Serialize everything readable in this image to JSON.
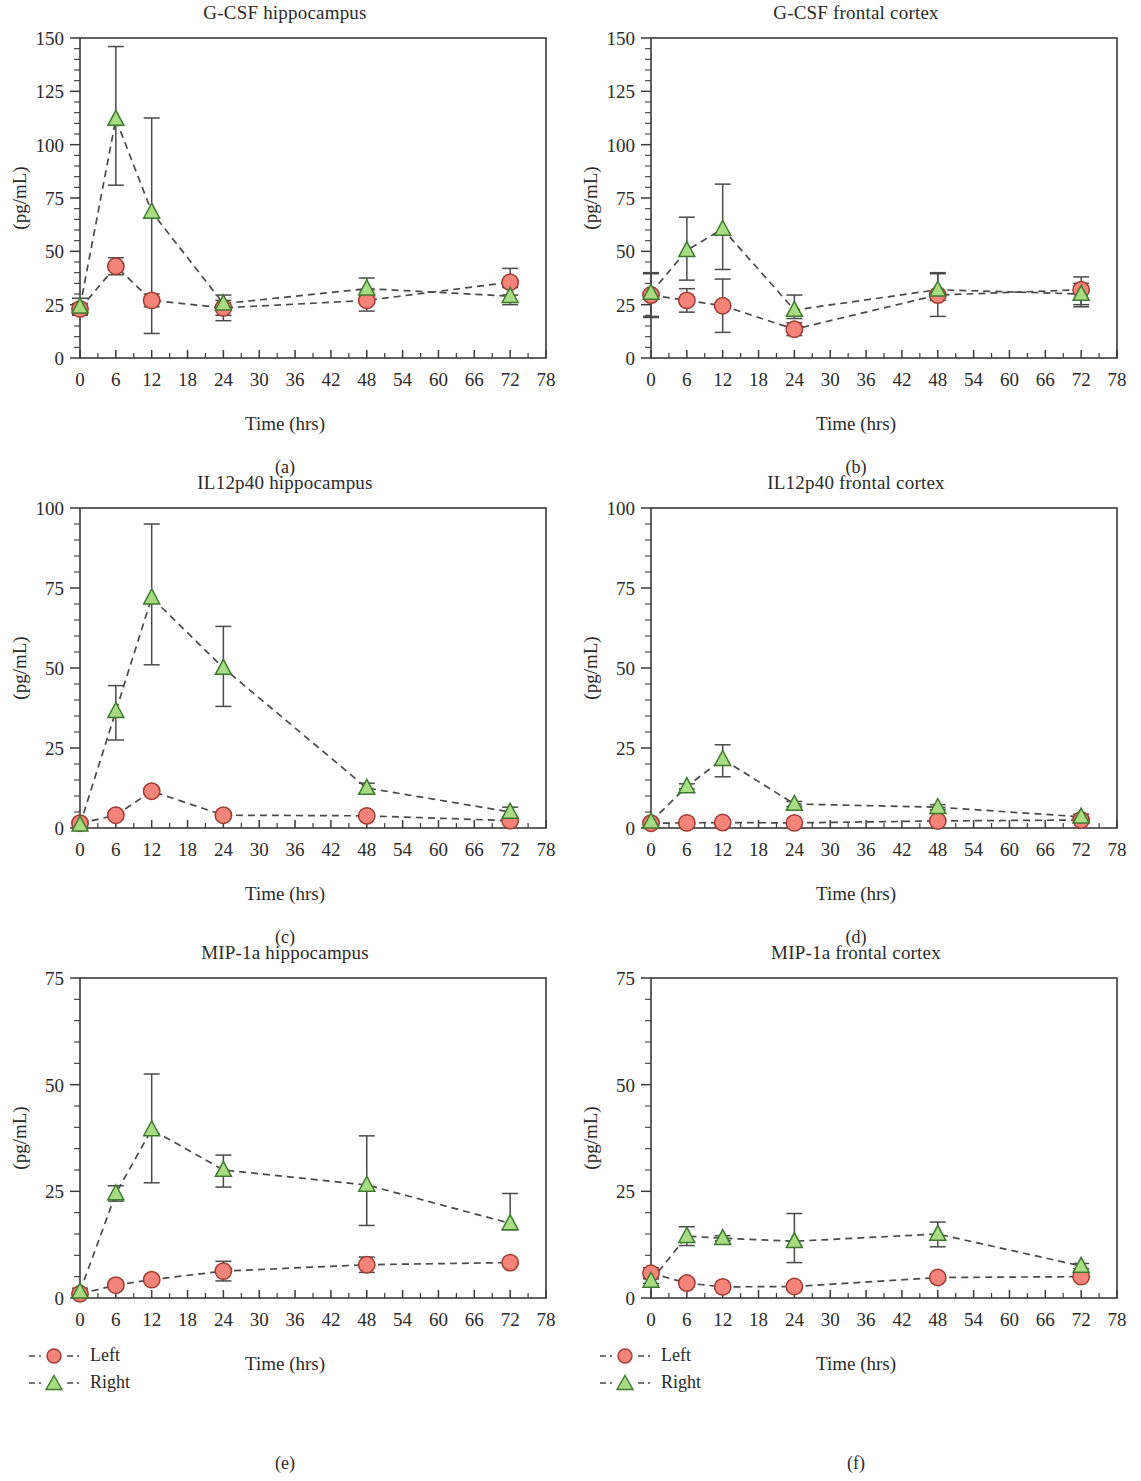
{
  "figure": {
    "xlabel": "Time (hrs)",
    "ylabel": "(pg/mL)",
    "legend": {
      "left_label": "Left",
      "right_label": "Right"
    },
    "colors": {
      "left_fill": "#F4837A",
      "left_stroke": "#9E3B33",
      "right_fill": "#A8DC82",
      "right_stroke": "#3E7A2E",
      "line": "#4A4A4A",
      "axis": "#3A3A3A",
      "text": "#2A2A2A"
    }
  },
  "panels": [
    {
      "letter": "(a)",
      "chart_data": {
        "type": "line",
        "title": "G-CSF hippocampus",
        "xlabel": "Time (hrs)",
        "ylabel": "(pg/mL)",
        "xlim": [
          0,
          78
        ],
        "ylim": [
          0,
          150
        ],
        "xticks": [
          0,
          6,
          12,
          18,
          24,
          30,
          36,
          42,
          48,
          54,
          60,
          66,
          72,
          78
        ],
        "yticks": [
          0,
          25,
          50,
          75,
          100,
          125,
          150
        ],
        "grid": false,
        "legend_position": "below-left",
        "x": [
          0,
          6,
          12,
          24,
          48,
          72
        ],
        "series": [
          {
            "name": "Left",
            "marker": "circle",
            "values": [
              23,
              43,
              27,
              23.5,
              27,
              35.5
            ],
            "err_low": [
              2.5,
              4,
              3,
              3.5,
              5,
              6
            ],
            "err_high": [
              2.5,
              4,
              3,
              3.5,
              5,
              6.5
            ]
          },
          {
            "name": "Right",
            "marker": "triangle",
            "values": [
              24,
              112,
              68.5,
              25.5,
              32.5,
              29
            ],
            "err_low": [
              4,
              31,
              57,
              8,
              5,
              4
            ],
            "err_high": [
              4,
              34,
              44,
              4,
              5,
              4
            ]
          }
        ]
      }
    },
    {
      "letter": "(b)",
      "chart_data": {
        "type": "line",
        "title": "G-CSF frontal cortex",
        "xlabel": "Time (hrs)",
        "ylabel": "(pg/mL)",
        "xlim": [
          0,
          78
        ],
        "ylim": [
          0,
          150
        ],
        "xticks": [
          0,
          6,
          12,
          18,
          24,
          30,
          36,
          42,
          48,
          54,
          60,
          66,
          72,
          78
        ],
        "yticks": [
          0,
          25,
          50,
          75,
          100,
          125,
          150
        ],
        "grid": false,
        "legend_position": "below-left",
        "x": [
          0,
          6,
          12,
          24,
          48,
          72
        ],
        "series": [
          {
            "name": "Left",
            "marker": "circle",
            "values": [
              29.5,
              27,
              24.5,
              13.5,
              29.5,
              32
            ],
            "err_low": [
              10.5,
              5.5,
              12.5,
              3,
              10,
              8
            ],
            "err_high": [
              10.5,
              5.5,
              12.5,
              3,
              10,
              6
            ]
          },
          {
            "name": "Right",
            "marker": "triangle",
            "values": [
              30.5,
              50.5,
              60.5,
              22.5,
              32,
              30
            ],
            "err_low": [
              11,
              14,
              19,
              4,
              5,
              5
            ],
            "err_high": [
              9,
              15.5,
              21,
              7,
              8,
              5
            ]
          }
        ]
      }
    },
    {
      "letter": "(c)",
      "chart_data": {
        "type": "line",
        "title": "IL12p40 hippocampus",
        "xlabel": "Time (hrs)",
        "ylabel": "(pg/mL)",
        "xlim": [
          0,
          78
        ],
        "ylim": [
          0,
          100
        ],
        "xticks": [
          0,
          6,
          12,
          18,
          24,
          30,
          36,
          42,
          48,
          54,
          60,
          66,
          72,
          78
        ],
        "yticks": [
          0,
          25,
          50,
          75,
          100
        ],
        "grid": false,
        "legend_position": "below-left",
        "x": [
          0,
          6,
          12,
          24,
          48,
          72
        ],
        "series": [
          {
            "name": "Left",
            "marker": "circle",
            "values": [
              1.5,
              4,
              11.5,
              4,
              3.8,
              2.3
            ],
            "err_low": [
              0.8,
              0.5,
              0.5,
              0.5,
              0.5,
              0.5
            ],
            "err_high": [
              0.8,
              0.5,
              0.5,
              0.5,
              0.5,
              0.5
            ]
          },
          {
            "name": "Right",
            "marker": "triangle",
            "values": [
              1,
              36.5,
              72,
              50,
              12.5,
              5
            ],
            "err_low": [
              0.5,
              9,
              21,
              12,
              1.5,
              1.5
            ],
            "err_high": [
              0.5,
              8,
              23,
              13,
              1.5,
              1.5
            ]
          }
        ]
      }
    },
    {
      "letter": "(d)",
      "chart_data": {
        "type": "line",
        "title": "IL12p40 frontal cortex",
        "xlabel": "Time (hrs)",
        "ylabel": "(pg/mL)",
        "xlim": [
          0,
          78
        ],
        "ylim": [
          0,
          100
        ],
        "xticks": [
          0,
          6,
          12,
          18,
          24,
          30,
          36,
          42,
          48,
          54,
          60,
          66,
          72,
          78
        ],
        "yticks": [
          0,
          25,
          50,
          75,
          100
        ],
        "grid": false,
        "legend_position": "below-left",
        "x": [
          0,
          6,
          12,
          24,
          48,
          72
        ],
        "series": [
          {
            "name": "Left",
            "marker": "circle",
            "values": [
              1.5,
              1.6,
              1.7,
              1.6,
              2.2,
              2.5
            ],
            "err_low": [
              0.4,
              0.3,
              0.3,
              0.3,
              0.4,
              0.4
            ],
            "err_high": [
              0.4,
              0.3,
              0.3,
              0.3,
              0.4,
              0.4
            ]
          },
          {
            "name": "Right",
            "marker": "triangle",
            "values": [
              2,
              13,
              21.5,
              7.5,
              6.5,
              3.5
            ],
            "err_low": [
              0.5,
              0.8,
              5.5,
              0.8,
              0.8,
              0.8
            ],
            "err_high": [
              0.5,
              0.8,
              4.5,
              0.8,
              0.8,
              0.8
            ]
          }
        ]
      }
    },
    {
      "letter": "(e)",
      "chart_data": {
        "type": "line",
        "title": "MIP-1a hippocampus",
        "xlabel": "Time (hrs)",
        "ylabel": "(pg/mL)",
        "xlim": [
          0,
          78
        ],
        "ylim": [
          0,
          75
        ],
        "xticks": [
          0,
          6,
          12,
          18,
          24,
          30,
          36,
          42,
          48,
          54,
          60,
          66,
          72,
          78
        ],
        "yticks": [
          0,
          25,
          50,
          75
        ],
        "grid": false,
        "legend_position": "below-left",
        "x": [
          0,
          6,
          12,
          24,
          48,
          72
        ],
        "series": [
          {
            "name": "Left",
            "marker": "circle",
            "values": [
              1,
              3,
              4.3,
              6.3,
              7.8,
              8.3
            ],
            "err_low": [
              0.5,
              0.5,
              0.5,
              2.3,
              1.8,
              0.5
            ],
            "err_high": [
              0.5,
              0.5,
              0.5,
              2.3,
              1.8,
              0.5
            ]
          },
          {
            "name": "Right",
            "marker": "triangle",
            "values": [
              1.5,
              24.5,
              39.5,
              30,
              26.5,
              17.5
            ],
            "err_low": [
              0.8,
              1.8,
              12.5,
              4,
              9.5,
              1.5
            ],
            "err_high": [
              0.8,
              1.8,
              13,
              3.5,
              11.5,
              7
            ]
          }
        ]
      }
    },
    {
      "letter": "(f)",
      "chart_data": {
        "type": "line",
        "title": "MIP-1a frontal cortex",
        "xlabel": "Time (hrs)",
        "ylabel": "(pg/mL)",
        "xlim": [
          0,
          78
        ],
        "ylim": [
          0,
          75
        ],
        "xticks": [
          0,
          6,
          12,
          18,
          24,
          30,
          36,
          42,
          48,
          54,
          60,
          66,
          72,
          78
        ],
        "yticks": [
          0,
          25,
          50,
          75
        ],
        "grid": false,
        "legend_position": "below-left",
        "x": [
          0,
          6,
          12,
          24,
          48,
          72
        ],
        "series": [
          {
            "name": "Left",
            "marker": "circle",
            "values": [
              5.8,
              3.5,
              2.6,
              2.7,
              4.8,
              5
            ],
            "err_low": [
              1.3,
              0.9,
              0.4,
              0.4,
              0.5,
              0.5
            ],
            "err_high": [
              1.3,
              0.9,
              0.4,
              0.4,
              0.5,
              0.5
            ]
          },
          {
            "name": "Right",
            "marker": "triangle",
            "values": [
              4,
              14.5,
              14,
              13.3,
              15,
              7.5
            ],
            "err_low": [
              0.6,
              2.2,
              0.6,
              5,
              3,
              0.6
            ],
            "err_high": [
              0.6,
              2.2,
              0.6,
              6.5,
              2.8,
              0.6
            ]
          }
        ]
      }
    }
  ]
}
